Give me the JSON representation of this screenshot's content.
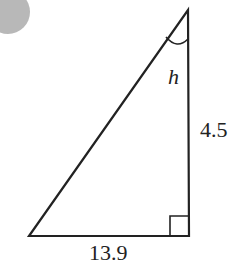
{
  "diagram": {
    "type": "right-triangle",
    "labels": {
      "angle": "h",
      "vertical_side": "4.5",
      "horizontal_side": "13.9"
    },
    "colors": {
      "stroke": "#222222",
      "background": "#ffffff",
      "corner_badge": "#b8b8b8"
    }
  }
}
